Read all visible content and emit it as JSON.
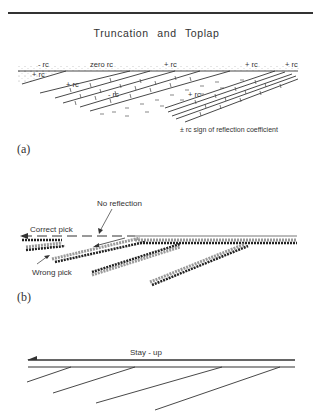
{
  "figure": {
    "title": "Truncation and Toplap",
    "panels": [
      {
        "id": "a",
        "label": "(a)",
        "annotations": [
          "- rc",
          "zero rc",
          "+ rc",
          "+ rc",
          "+ rc",
          "+ rc",
          "+ rc",
          "- rc",
          "+ rc"
        ],
        "legend": "± rc  sign of reflection coefficient"
      },
      {
        "id": "b",
        "label": "(b)",
        "annotations": {
          "no_reflection": "No reflection",
          "correct_pick": "Correct pick",
          "wrong_pick": "Wrong pick"
        }
      },
      {
        "id": "c",
        "label": "",
        "annotations": {
          "stay_up": "Stay - up"
        }
      }
    ]
  },
  "colors": {
    "ink": "#333333",
    "background": "#ffffff"
  }
}
